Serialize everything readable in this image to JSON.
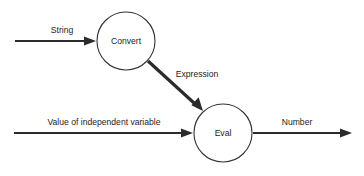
{
  "diagram": {
    "background_color": "#ffffff",
    "line_color": "#2b2b2b",
    "text_color": "#1c1c1c",
    "nodes": [
      {
        "id": "convert",
        "label": "Convert",
        "cx": 126,
        "cy": 41,
        "r": 29
      },
      {
        "id": "eval",
        "label": "Eval",
        "cx": 223,
        "cy": 133,
        "r": 29
      }
    ],
    "edges": [
      {
        "id": "string-in",
        "label": "String",
        "from": "input",
        "to": "convert",
        "x1": 15,
        "y1": 41,
        "x2": 96,
        "y2": 41,
        "label_x": 62,
        "label_y": 31,
        "weight": "thin"
      },
      {
        "id": "expression",
        "label": "Expression",
        "from": "convert",
        "to": "eval",
        "x1": 148,
        "y1": 61,
        "x2": 202,
        "y2": 110,
        "label_x": 197,
        "label_y": 75,
        "weight": "thick"
      },
      {
        "id": "independent-variable-in",
        "label": "Value of independent variable",
        "from": "input",
        "to": "eval",
        "x1": 14,
        "y1": 133,
        "x2": 193,
        "y2": 133,
        "label_x": 104,
        "label_y": 123,
        "weight": "thin"
      },
      {
        "id": "number-out",
        "label": "Number",
        "from": "eval",
        "to": "output",
        "x1": 253,
        "y1": 133,
        "x2": 352,
        "y2": 133,
        "label_x": 297,
        "label_y": 123,
        "weight": "thin"
      }
    ]
  }
}
